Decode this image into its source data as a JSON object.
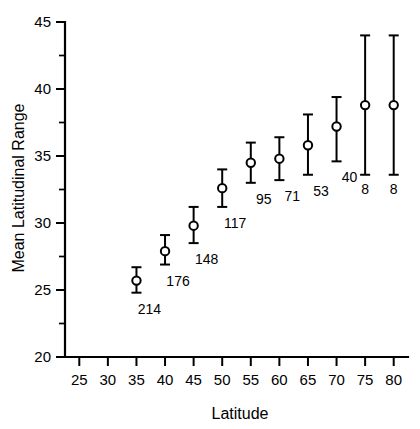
{
  "chart_data": {
    "type": "scatter",
    "title": "",
    "xlabel": "Latitude",
    "ylabel": "Mean Latitudinal Range",
    "xlim": [
      22.5,
      82.5
    ],
    "ylim": [
      20,
      45
    ],
    "grid": false,
    "legend": "none",
    "x_ticks": [
      25,
      30,
      35,
      40,
      45,
      50,
      55,
      60,
      65,
      70,
      75,
      80
    ],
    "x_tick_labels": [
      "25",
      "30",
      "35",
      "40",
      "45",
      "50",
      "55",
      "60",
      "65",
      "70",
      "75",
      "80"
    ],
    "y_ticks": [
      20,
      25,
      30,
      35,
      40,
      45
    ],
    "y_tick_labels": [
      "20",
      "25",
      "30",
      "35",
      "40",
      "45"
    ],
    "y_minor_ticks": [
      22.5,
      27.5,
      32.5,
      37.5,
      42.5
    ],
    "marker": "open-circle",
    "error_bars": "vertical-with-caps",
    "x": [
      35,
      40,
      45,
      50,
      55,
      60,
      65,
      70,
      75,
      80
    ],
    "values": [
      25.7,
      27.9,
      29.8,
      32.6,
      34.5,
      34.8,
      35.8,
      37.2,
      38.8,
      38.8
    ],
    "err_low": [
      24.8,
      26.9,
      28.5,
      31.2,
      33.0,
      33.2,
      33.6,
      34.6,
      33.6,
      33.6
    ],
    "err_high": [
      26.7,
      29.1,
      31.2,
      34.0,
      36.0,
      36.4,
      38.1,
      39.4,
      44.0,
      44.0
    ],
    "point_labels": [
      "214",
      "176",
      "148",
      "117",
      "95",
      "71",
      "53",
      "40",
      "8",
      "8"
    ],
    "point_label_note": "sample size n per latitude bin"
  }
}
